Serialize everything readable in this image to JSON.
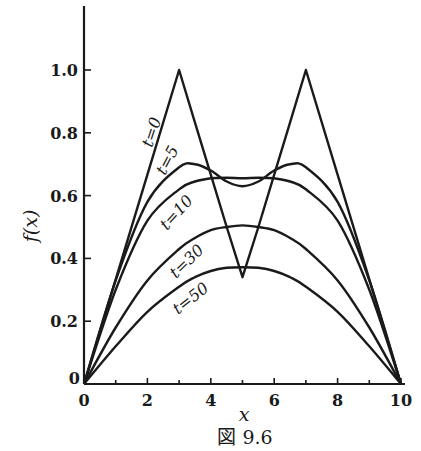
{
  "caption": "図 9.6",
  "chart_data": {
    "type": "line",
    "title": "",
    "caption": "図 9.6",
    "xlabel": "x",
    "ylabel": "f(x)",
    "xlim": [
      0,
      10
    ],
    "ylim": [
      0,
      1.2
    ],
    "grid": false,
    "legend": "inline labels on curves",
    "x_ticks": [
      0,
      2,
      4,
      6,
      8,
      10
    ],
    "x_tick_labels": [
      "0",
      "2",
      "4",
      "6",
      "8",
      "10"
    ],
    "x_minor_ticks": [
      1,
      3,
      5,
      7,
      9
    ],
    "y_ticks": [
      0,
      0.2,
      0.4,
      0.6,
      0.8,
      1.0
    ],
    "y_tick_labels": [
      "0",
      "0.2",
      "0.4",
      "0.6",
      "0.8",
      "1.0"
    ],
    "x": [
      0,
      1,
      2,
      3,
      3.5,
      4,
      4.5,
      5,
      5.5,
      6,
      6.5,
      7,
      8,
      9,
      10
    ],
    "series": [
      {
        "name": "t=0",
        "label": "t=0",
        "values": [
          0,
          0.333,
          0.667,
          1.0,
          0.833,
          0.667,
          0.5,
          0.34,
          0.5,
          0.667,
          0.833,
          1.0,
          0.667,
          0.333,
          0
        ]
      },
      {
        "name": "t=5",
        "label": "t=5",
        "values": [
          0,
          0.33,
          0.58,
          0.69,
          0.7,
          0.68,
          0.645,
          0.63,
          0.645,
          0.68,
          0.7,
          0.69,
          0.58,
          0.33,
          0
        ]
      },
      {
        "name": "t=10",
        "label": "t=10",
        "values": [
          0,
          0.3,
          0.52,
          0.62,
          0.645,
          0.655,
          0.657,
          0.655,
          0.657,
          0.655,
          0.645,
          0.62,
          0.52,
          0.3,
          0
        ]
      },
      {
        "name": "t=30",
        "label": "t=30",
        "values": [
          0,
          0.18,
          0.33,
          0.43,
          0.465,
          0.49,
          0.5,
          0.505,
          0.5,
          0.49,
          0.465,
          0.43,
          0.33,
          0.18,
          0
        ]
      },
      {
        "name": "t=50",
        "label": "t=50",
        "values": [
          0,
          0.12,
          0.23,
          0.31,
          0.34,
          0.36,
          0.37,
          0.372,
          0.37,
          0.36,
          0.34,
          0.31,
          0.23,
          0.12,
          0
        ]
      }
    ],
    "annotations": [
      "t=0",
      "t=5",
      "t=10",
      "t=30",
      "t=50"
    ]
  }
}
